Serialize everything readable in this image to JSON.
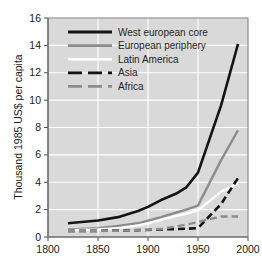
{
  "chart_data": {
    "type": "line",
    "title": "",
    "xlabel": "",
    "ylabel": "Thousand 1985 US$ per capita",
    "xlim": [
      1800,
      2000
    ],
    "ylim": [
      0,
      16
    ],
    "xticks": [
      1800,
      1850,
      1900,
      1950,
      2000
    ],
    "yticks": [
      0,
      2,
      4,
      6,
      8,
      10,
      12,
      14,
      16
    ],
    "xtick_labels": [
      "1800",
      "1850",
      "1900",
      "1950",
      "2000"
    ],
    "ytick_labels": [
      "0",
      "2",
      "4",
      "6",
      "8",
      "10",
      "12",
      "14",
      "16"
    ],
    "grid": true,
    "grid_color": "#ffffff",
    "plot_background": "#d9d9d9",
    "legend_position": "upper-left",
    "series": [
      {
        "name": "West european core",
        "style": "solid",
        "color": "#141414",
        "width": 2.6,
        "x": [
          1820,
          1850,
          1870,
          1890,
          1900,
          1913,
          1929,
          1938,
          1950,
          1973,
          1990
        ],
        "values": [
          1.0,
          1.2,
          1.45,
          1.9,
          2.2,
          2.7,
          3.2,
          3.6,
          4.7,
          9.6,
          14.1
        ]
      },
      {
        "name": "European periphery",
        "style": "solid",
        "color": "#8c8c8c",
        "width": 2.4,
        "x": [
          1820,
          1850,
          1870,
          1890,
          1900,
          1913,
          1929,
          1938,
          1950,
          1973,
          1990
        ],
        "values": [
          0.55,
          0.65,
          0.8,
          1.0,
          1.2,
          1.45,
          1.8,
          2.0,
          2.3,
          5.6,
          7.8
        ]
      },
      {
        "name": "Latin America",
        "style": "solid",
        "color": "#ffffff",
        "width": 2.4,
        "x": [
          1820,
          1850,
          1870,
          1890,
          1900,
          1913,
          1929,
          1938,
          1950,
          1973,
          1990
        ],
        "values": [
          0.5,
          0.55,
          0.65,
          0.85,
          1.0,
          1.25,
          1.55,
          1.7,
          1.95,
          3.3,
          3.9
        ]
      },
      {
        "name": "Asia",
        "style": "dashed",
        "color": "#141414",
        "width": 2.6,
        "x": [
          1820,
          1850,
          1870,
          1890,
          1913,
          1938,
          1950,
          1973,
          1990
        ],
        "values": [
          0.45,
          0.45,
          0.48,
          0.5,
          0.55,
          0.6,
          0.65,
          2.4,
          4.3
        ]
      },
      {
        "name": "Africa",
        "style": "dashed",
        "color": "#8c8c8c",
        "width": 2.4,
        "x": [
          1820,
          1850,
          1870,
          1890,
          1913,
          1938,
          1950,
          1973,
          1990
        ],
        "values": [
          0.42,
          0.44,
          0.46,
          0.5,
          0.58,
          0.9,
          1.1,
          1.5,
          1.5
        ]
      }
    ],
    "legend_entries": [
      {
        "label": "West european core",
        "color": "#141414",
        "style": "solid"
      },
      {
        "label": "European periphery",
        "color": "#8c8c8c",
        "style": "solid"
      },
      {
        "label": "Latin America",
        "color": "#ffffff",
        "style": "solid"
      },
      {
        "label": "Asia",
        "color": "#141414",
        "style": "dashed"
      },
      {
        "label": "Africa",
        "color": "#8c8c8c",
        "style": "dashed"
      }
    ]
  }
}
